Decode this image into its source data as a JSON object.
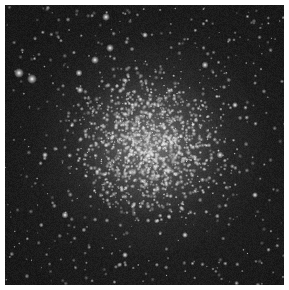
{
  "image": {
    "subject": "globular star cluster",
    "description": "Grayscale telescope image of a dense globular star cluster, bright diffuse core at center with scattered bright stars on a dark background",
    "colors": {
      "background": "#1c1c1c",
      "core": "#bebebe",
      "border": "#ffffff"
    }
  }
}
